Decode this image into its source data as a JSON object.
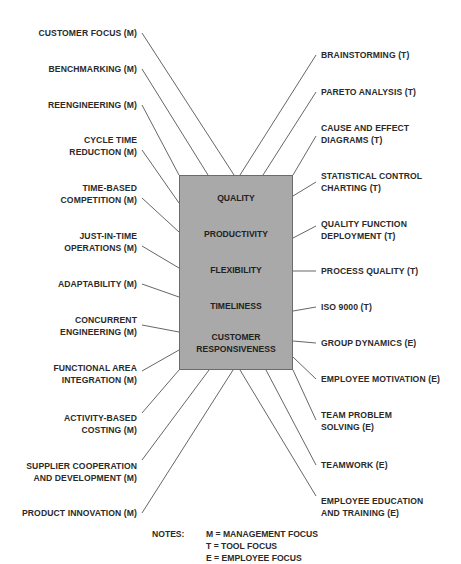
{
  "diagram": {
    "center_box": {
      "fill_color": "#a9a9a9",
      "objectives": [
        {
          "label": "QUALITY"
        },
        {
          "label": "PRODUCTIVITY"
        },
        {
          "label": "FLEXIBILITY"
        },
        {
          "label": "TIMELINESS"
        },
        {
          "label": "CUSTOMER\nRESPONSIVENESS",
          "line1": "CUSTOMER",
          "line2": "RESPONSIVENESS"
        }
      ]
    },
    "left_items": [
      {
        "line1": "CUSTOMER FOCUS (M)",
        "line2": ""
      },
      {
        "line1": "BENCHMARKING (M)",
        "line2": ""
      },
      {
        "line1": "REENGINEERING (M)",
        "line2": ""
      },
      {
        "line1": "CYCLE TIME",
        "line2": "REDUCTION (M)"
      },
      {
        "line1": "TIME-BASED",
        "line2": "COMPETITION (M)"
      },
      {
        "line1": "JUST-IN-TIME",
        "line2": "OPERATIONS (M)"
      },
      {
        "line1": "ADAPTABILITY (M)",
        "line2": ""
      },
      {
        "line1": "CONCURRENT",
        "line2": "ENGINEERING (M)"
      },
      {
        "line1": "FUNCTIONAL AREA",
        "line2": "INTEGRATION (M)"
      },
      {
        "line1": "ACTIVITY-BASED",
        "line2": "COSTING (M)"
      },
      {
        "line1": "SUPPLIER COOPERATION",
        "line2": "AND DEVELOPMENT (M)"
      },
      {
        "line1": "PRODUCT INNOVATION (M)",
        "line2": ""
      }
    ],
    "right_items": [
      {
        "line1": "BRAINSTORMING (T)",
        "line2": ""
      },
      {
        "line1": "PARETO ANALYSIS (T)",
        "line2": ""
      },
      {
        "line1": "CAUSE AND EFFECT",
        "line2": "DIAGRAMS (T)"
      },
      {
        "line1": "STATISTICAL CONTROL",
        "line2": "CHARTING (T)"
      },
      {
        "line1": "QUALITY FUNCTION",
        "line2": "DEPLOYMENT (T)"
      },
      {
        "line1": "PROCESS QUALITY (T)",
        "line2": ""
      },
      {
        "line1": "ISO 9000 (T)",
        "line2": ""
      },
      {
        "line1": "GROUP DYNAMICS (E)",
        "line2": ""
      },
      {
        "line1": "EMPLOYEE MOTIVATION (E)",
        "line2": ""
      },
      {
        "line1": "TEAM PROBLEM",
        "line2": "SOLVING (E)"
      },
      {
        "line1": "TEAMWORK (E)",
        "line2": ""
      },
      {
        "line1": "EMPLOYEE EDUCATION",
        "line2": "AND TRAINING (E)"
      }
    ],
    "notes": {
      "heading": "NOTES:",
      "items": [
        "M = MANAGEMENT FOCUS",
        "T = TOOL FOCUS",
        "E = EMPLOYEE FOCUS"
      ]
    }
  }
}
